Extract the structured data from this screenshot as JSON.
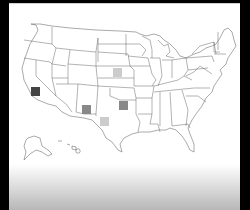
{
  "map": {
    "title": "",
    "region": "United States",
    "style": {
      "background": "#ffffff",
      "frame": "#000000",
      "outline": "#555555"
    },
    "markers": [
      {
        "id": "california",
        "state": "CA",
        "x": 31,
        "y": 87,
        "size": 9,
        "color": "#444444",
        "shade": "dark"
      },
      {
        "id": "kansas-nebraska",
        "state": "KS",
        "x": 113,
        "y": 68,
        "size": 9,
        "color": "#cccccc",
        "shade": "light"
      },
      {
        "id": "arizona",
        "state": "AZ",
        "x": 82,
        "y": 105,
        "size": 9,
        "color": "#888888",
        "shade": "medium"
      },
      {
        "id": "oklahoma",
        "state": "OK",
        "x": 119,
        "y": 101,
        "size": 9,
        "color": "#888888",
        "shade": "medium"
      },
      {
        "id": "texas",
        "state": "TX",
        "x": 100,
        "y": 117,
        "size": 9,
        "color": "#cccccc",
        "shade": "light"
      }
    ]
  }
}
